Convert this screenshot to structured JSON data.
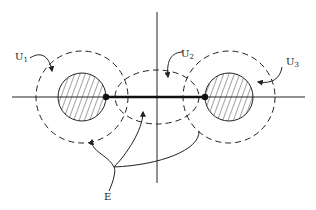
{
  "diagram": {
    "type": "topology-neighborhoods",
    "colors": {
      "ink": "#222222",
      "background": "#ffffff"
    },
    "labels": {
      "u1": {
        "base": "U",
        "sub": "1"
      },
      "u2": {
        "base": "U",
        "sub": "2"
      },
      "u3": {
        "base": "U",
        "sub": "3"
      },
      "e": "E"
    },
    "elements": {
      "axes": {
        "horizontal": true,
        "vertical": true
      },
      "left_disk": {
        "shape": "circle",
        "fill": "hatched"
      },
      "right_disk": {
        "shape": "circle",
        "fill": "hatched"
      },
      "u1_region": {
        "shape": "dashed-circle",
        "surrounds": "left_disk"
      },
      "u2_region": {
        "shape": "dashed-ellipse",
        "surrounds": "origin"
      },
      "u3_region": {
        "shape": "dashed-circle",
        "surrounds": "right_disk"
      },
      "segment_E": {
        "shape": "thick-segment",
        "between": [
          "left_disk",
          "right_disk"
        ],
        "endpoints": "dots"
      }
    }
  }
}
